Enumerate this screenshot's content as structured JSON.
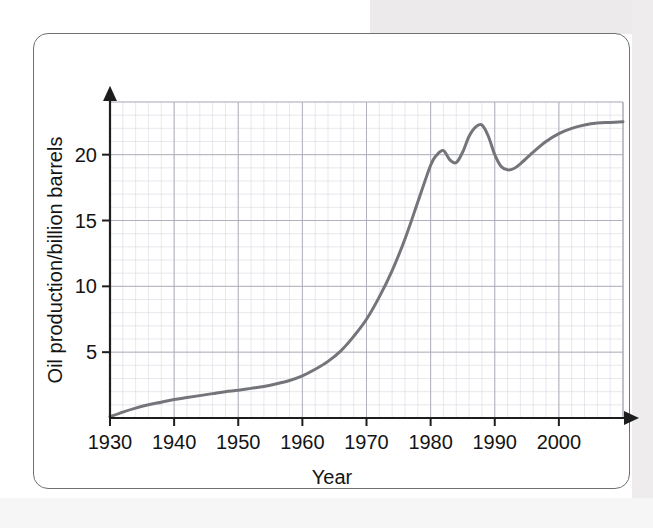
{
  "figure": {
    "frame_color": "#6f7072",
    "background": "#ffffff"
  },
  "chart_data": {
    "type": "line",
    "title": "",
    "xlabel": "Year",
    "ylabel": "Oil production/billion barrels",
    "xlim": [
      1930,
      2010
    ],
    "ylim": [
      0,
      24
    ],
    "xticks": [
      1930,
      1940,
      1950,
      1960,
      1970,
      1980,
      1990,
      2000
    ],
    "xtick_labels": [
      "1930",
      "1940",
      "1950",
      "1960",
      "1970",
      "1980",
      "1990",
      "2000"
    ],
    "yticks": [
      5,
      10,
      15,
      20
    ],
    "ytick_labels": [
      "5",
      "10",
      "15",
      "20"
    ],
    "grid": true,
    "grid_major_step_x": 10,
    "grid_major_step_y": 5,
    "grid_minor_step_x": 2,
    "grid_minor_step_y": 1,
    "legend": "none",
    "line_color": "#74757a",
    "line_width": 3.0,
    "series": [
      {
        "name": "World oil production",
        "x": [
          1930,
          1932,
          1934,
          1936,
          1938,
          1940,
          1942,
          1944,
          1946,
          1948,
          1950,
          1952,
          1954,
          1956,
          1958,
          1960,
          1962,
          1964,
          1966,
          1968,
          1970,
          1972,
          1974,
          1976,
          1978,
          1980,
          1981,
          1982,
          1983,
          1984,
          1985,
          1986,
          1987,
          1988,
          1989,
          1990,
          1991,
          1992,
          1993,
          1994,
          1996,
          1998,
          2000,
          2002,
          2004,
          2006,
          2008,
          2010
        ],
        "values": [
          0.1,
          0.45,
          0.75,
          1.0,
          1.2,
          1.4,
          1.55,
          1.7,
          1.85,
          2.0,
          2.1,
          2.25,
          2.4,
          2.6,
          2.85,
          3.2,
          3.7,
          4.3,
          5.1,
          6.2,
          7.5,
          9.2,
          11.2,
          13.6,
          16.4,
          19.2,
          20.0,
          20.3,
          19.6,
          19.4,
          20.2,
          21.4,
          22.1,
          22.25,
          21.4,
          20.0,
          19.1,
          18.85,
          18.95,
          19.3,
          20.2,
          21.0,
          21.6,
          22.0,
          22.25,
          22.4,
          22.45,
          22.5
        ]
      }
    ]
  },
  "axes": {
    "y_arrow": true,
    "x_arrow": true
  }
}
